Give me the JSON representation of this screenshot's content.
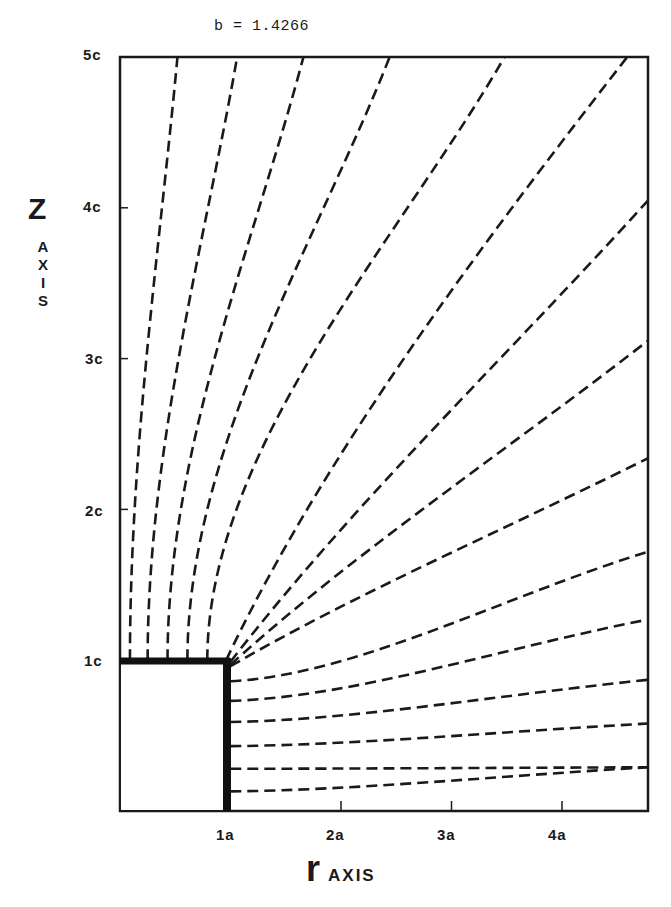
{
  "chart_data": {
    "type": "diagram",
    "title": "b = 1.4266",
    "xlabel": "r AXIS",
    "ylabel": "Z AXIS",
    "x_unit": "a",
    "y_unit": "c",
    "xlim": [
      0,
      4.8
    ],
    "ylim": [
      0,
      5
    ],
    "x_ticks": [
      {
        "value": 1,
        "label": "1a"
      },
      {
        "value": 2,
        "label": "2a"
      },
      {
        "value": 3,
        "label": "3a"
      },
      {
        "value": 4,
        "label": "4a"
      }
    ],
    "y_ticks": [
      {
        "value": 1,
        "label": "1c"
      },
      {
        "value": 2,
        "label": "2c"
      },
      {
        "value": 3,
        "label": "3c"
      },
      {
        "value": 4,
        "label": "4c"
      },
      {
        "value": 5,
        "label": "5c"
      }
    ],
    "grid": false,
    "obstacle": {
      "shape": "rectangle",
      "r_from": 0,
      "r_to": 1,
      "z_from": 0,
      "z_to": 1,
      "edge": "thick top and right edge"
    },
    "line_style": "dashed",
    "field_lines": [
      {
        "start": [
          0.09,
          1.0
        ],
        "end": [
          0.52,
          5.0
        ]
      },
      {
        "start": [
          0.25,
          1.0
        ],
        "end": [
          1.06,
          5.0
        ]
      },
      {
        "start": [
          0.43,
          1.0
        ],
        "end": [
          1.66,
          5.0
        ]
      },
      {
        "start": [
          0.61,
          1.0
        ],
        "end": [
          2.44,
          5.0
        ]
      },
      {
        "start": [
          0.79,
          1.0
        ],
        "end": [
          3.48,
          5.0
        ]
      },
      {
        "start": [
          0.96,
          1.0
        ],
        "end": [
          4.59,
          5.0
        ]
      },
      {
        "start": [
          1.0,
          0.99
        ],
        "end": [
          4.78,
          4.05
        ]
      },
      {
        "start": [
          1.0,
          0.97
        ],
        "end": [
          4.78,
          3.12
        ]
      },
      {
        "start": [
          1.0,
          0.96
        ],
        "end": [
          4.78,
          2.34
        ]
      },
      {
        "start": [
          1.0,
          0.86
        ],
        "end": [
          4.78,
          1.72
        ]
      },
      {
        "start": [
          1.0,
          0.73
        ],
        "end": [
          4.78,
          1.27
        ]
      },
      {
        "start": [
          1.0,
          0.59
        ],
        "end": [
          4.78,
          0.87
        ]
      },
      {
        "start": [
          1.0,
          0.43
        ],
        "end": [
          4.78,
          0.58
        ]
      },
      {
        "start": [
          1.0,
          0.28
        ],
        "end": [
          4.78,
          0.29
        ]
      },
      {
        "start": [
          1.0,
          0.13
        ],
        "end": [
          4.78,
          0.29
        ]
      }
    ]
  },
  "labels": {
    "title": "b = 1.4266",
    "y_main": "Z",
    "y_sub": [
      "A",
      "X",
      "I",
      "S"
    ],
    "x_main": "r",
    "x_sub": "AXIS",
    "x_ticks": [
      "1a",
      "2a",
      "3a",
      "4a"
    ],
    "y_ticks": [
      "1c",
      "2c",
      "3c",
      "4c",
      "5c"
    ]
  },
  "colors": {
    "ink": "#1a1a1a",
    "background": "#ffffff"
  }
}
